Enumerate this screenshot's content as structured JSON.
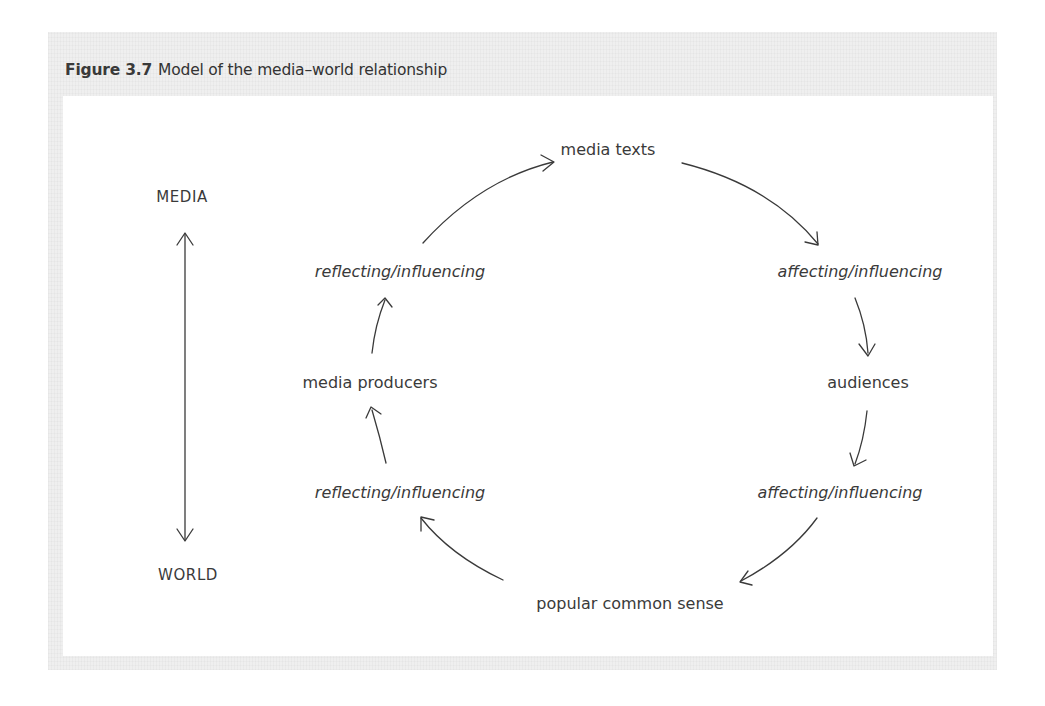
{
  "figure": {
    "number": "Figure 3.7",
    "title": "Model of the media–world relationship"
  },
  "axis": {
    "top_label": "MEDIA",
    "bottom_label": "WORLD"
  },
  "cycle": {
    "nodes": [
      {
        "id": "media_texts",
        "label": "media texts"
      },
      {
        "id": "audiences",
        "label": "audiences"
      },
      {
        "id": "popular_common_sense",
        "label": "popular common sense"
      },
      {
        "id": "media_producers",
        "label": "media producers"
      }
    ],
    "links": [
      {
        "label": "affecting/influencing",
        "from": "media texts",
        "to": "audiences"
      },
      {
        "label": "affecting/influencing",
        "from": "audiences",
        "to": "popular common sense"
      },
      {
        "label": "reflecting/influencing",
        "from": "popular common sense",
        "to": "media producers"
      },
      {
        "label": "reflecting/influencing",
        "from": "media producers",
        "to": "media texts"
      }
    ]
  },
  "colors": {
    "text": "#3a3a3a",
    "frame": "#efefef",
    "panel": "#ffffff"
  }
}
